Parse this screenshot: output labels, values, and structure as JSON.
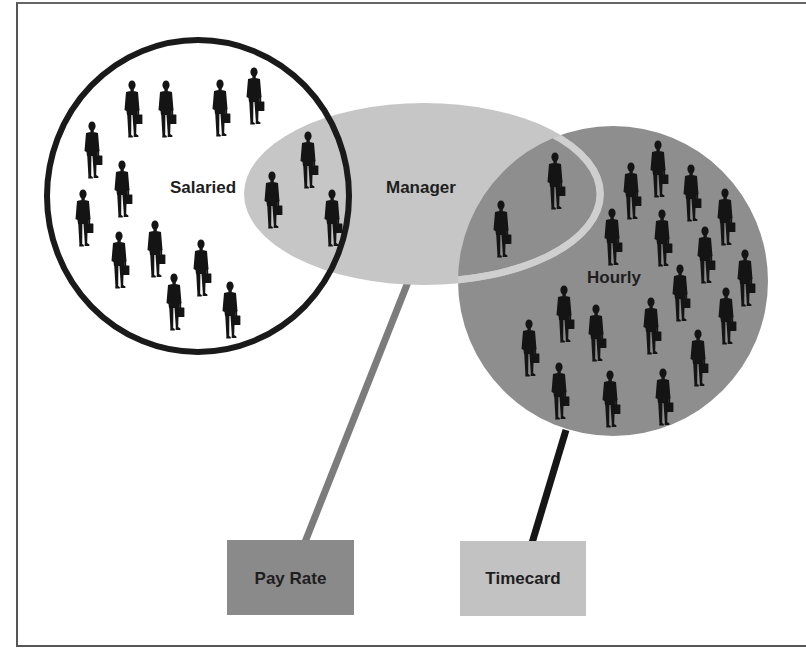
{
  "diagram": {
    "colors": {
      "background": "#ffffff",
      "salaried_stroke": "#1a1a1a",
      "manager_fill": "#c6c6c6",
      "manager_ring": "#cfcfcf",
      "hourly_fill": "#8e8e8e",
      "figure": "#141414",
      "payrate_box": "#8a8a8a",
      "payrate_line": "#7c7c7c",
      "timecard_box": "#c2c2c2",
      "timecard_line": "#161616",
      "label_text": "#1e1e1e"
    },
    "sets": [
      {
        "id": "salaried",
        "label": "Salaried",
        "fill": "none"
      },
      {
        "id": "manager",
        "label": "Manager",
        "fill": "light-gray"
      },
      {
        "id": "hourly",
        "label": "Hourly",
        "fill": "mid-gray"
      }
    ],
    "attributes": [
      {
        "id": "pay-rate",
        "label": "Pay Rate",
        "connected_to": "manager"
      },
      {
        "id": "timecard",
        "label": "Timecard",
        "connected_to": "hourly"
      }
    ],
    "figure_icon": "businessman-with-briefcase-icon",
    "figure_counts": {
      "salaried_only": 12,
      "salaried_and_manager": 3,
      "manager_and_hourly": 2,
      "hourly_only": 18
    }
  }
}
